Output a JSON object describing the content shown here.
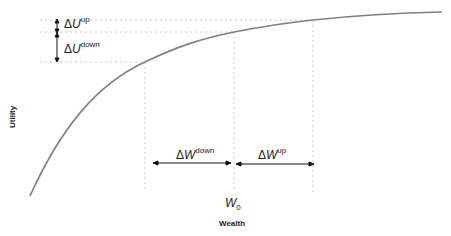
{
  "diagram": {
    "x_axis_label": "Wealth",
    "y_axis_label": "Utility",
    "w0_label": "W",
    "w0_sub": "0",
    "delta_w_down": {
      "delta": "Δ",
      "var": "W",
      "sup": "down"
    },
    "delta_w_up": {
      "delta": "Δ",
      "var": "W",
      "sup": "up"
    },
    "delta_u_up": {
      "delta": "Δ",
      "var": "U",
      "sup": "up"
    },
    "delta_u_down": {
      "delta": "Δ",
      "var": "U",
      "sup": "down"
    },
    "colors": {
      "curve": "#7f7f7f",
      "guides": "#c8c8c8",
      "arrows": "#111111"
    }
  }
}
